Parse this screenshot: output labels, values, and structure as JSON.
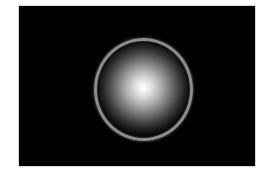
{
  "image": {
    "description": "Glowing white sphere with a thin gray ring on a black background",
    "colors": {
      "page_background": "#ffffff",
      "frame_background": "#000000",
      "ring": "#8c8c8c",
      "glow_center": "#ffffff"
    },
    "frame": {
      "x": 19,
      "y": 6,
      "width": 236,
      "height": 160
    },
    "ring": {
      "center_x": 143.5,
      "center_y": 89.5,
      "radius_x": 49.5,
      "radius_y": 51.5,
      "thickness": 3
    }
  }
}
